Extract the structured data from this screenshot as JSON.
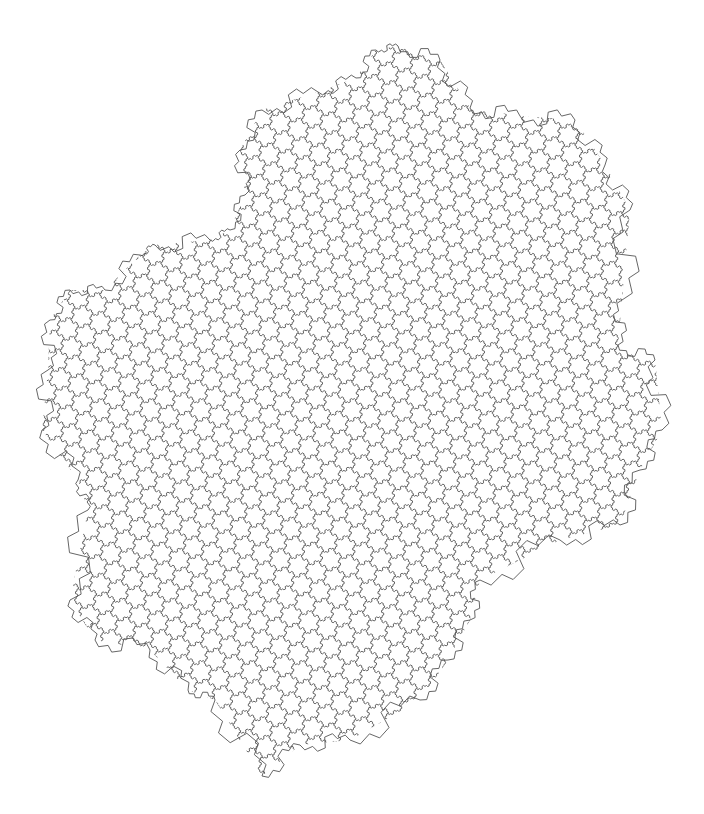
{
  "figure": {
    "description": "Gosper island (flowsnake) fractal tiling drawn as thin line outlines",
    "background": "#ffffff",
    "stroke_color": "#555555",
    "stroke_width": 0.9,
    "cell_radius": 11,
    "hex_angle_deg": 19.1,
    "silhouette": [
      [
        398,
        46
      ],
      [
        440,
        60
      ],
      [
        470,
        108
      ],
      [
        520,
        116
      ],
      [
        575,
        120
      ],
      [
        605,
        165
      ],
      [
        630,
        210
      ],
      [
        622,
        300
      ],
      [
        618,
        345
      ],
      [
        655,
        360
      ],
      [
        662,
        430
      ],
      [
        640,
        470
      ],
      [
        620,
        525
      ],
      [
        560,
        540
      ],
      [
        480,
        580
      ],
      [
        470,
        620
      ],
      [
        448,
        660
      ],
      [
        420,
        700
      ],
      [
        350,
        740
      ],
      [
        300,
        745
      ],
      [
        262,
        776
      ],
      [
        215,
        700
      ],
      [
        188,
        690
      ],
      [
        150,
        650
      ],
      [
        95,
        640
      ],
      [
        70,
        600
      ],
      [
        88,
        510
      ],
      [
        78,
        480
      ],
      [
        42,
        430
      ],
      [
        48,
        370
      ],
      [
        50,
        320
      ],
      [
        70,
        290
      ],
      [
        105,
        290
      ],
      [
        140,
        255
      ],
      [
        155,
        245
      ],
      [
        210,
        240
      ],
      [
        230,
        230
      ],
      [
        245,
        195
      ],
      [
        240,
        150
      ],
      [
        262,
        110
      ],
      [
        318,
        92
      ],
      [
        356,
        78
      ],
      [
        376,
        50
      ]
    ]
  }
}
